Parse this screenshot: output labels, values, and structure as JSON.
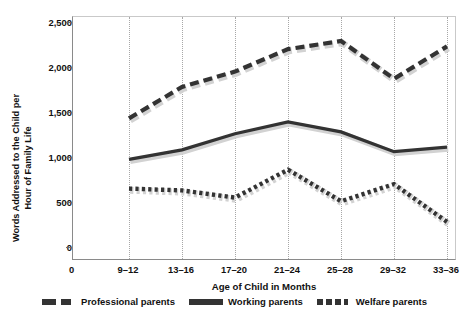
{
  "chart_data": {
    "type": "line",
    "title": "",
    "xlabel": "Age of Child in Months",
    "ylabel": "Words Addressed to the Child per\nHour of Family Life",
    "categories": [
      "9–12",
      "13–16",
      "17–20",
      "21–24",
      "25–28",
      "29–32",
      "33–36"
    ],
    "x_origin_label": "0",
    "ylim": [
      0,
      2500
    ],
    "yticks": [
      0,
      500,
      1000,
      1500,
      2000,
      2500
    ],
    "ytick_labels": [
      "0",
      "500",
      "1,000",
      "1,500",
      "2,000",
      "2,500"
    ],
    "grid": "vertical-dotted",
    "legend_position": "bottom",
    "series": [
      {
        "name": "Professional parents",
        "style": "dashed",
        "color": "#333333",
        "values": [
          1440,
          1790,
          1960,
          2210,
          2300,
          1880,
          2240
        ]
      },
      {
        "name": "Working parents",
        "style": "solid",
        "color": "#333333",
        "values": [
          985,
          1090,
          1270,
          1400,
          1290,
          1070,
          1120
        ]
      },
      {
        "name": "Welfare parents",
        "style": "dotted",
        "color": "#333333",
        "values": [
          660,
          640,
          560,
          870,
          520,
          710,
          290
        ]
      }
    ]
  },
  "legend": {
    "items": [
      {
        "label": "Professional parents",
        "swatch": "dashed-swatch"
      },
      {
        "label": "Working parents",
        "swatch": "solid-swatch"
      },
      {
        "label": "Welfare parents",
        "swatch": "dotted-swatch"
      }
    ]
  }
}
